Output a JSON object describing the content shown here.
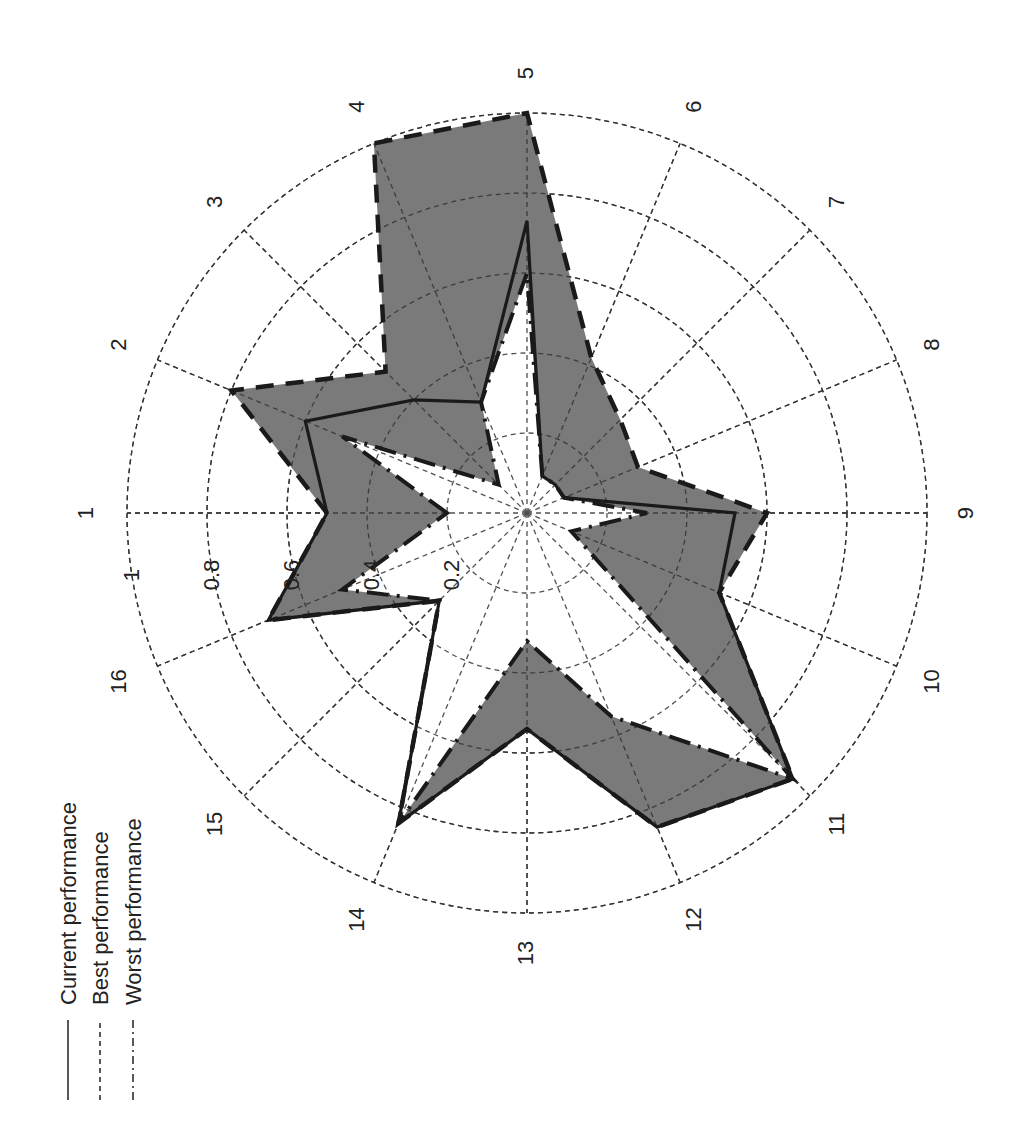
{
  "chart_data": {
    "type": "radar",
    "orientation": "figure rotated 90 degrees counter-clockwise; spoke 1 points left, spoke 5 up, spoke 9 right, spoke 13 down",
    "categories": [
      "1",
      "2",
      "3",
      "4",
      "5",
      "6",
      "7",
      "8",
      "9",
      "10",
      "11",
      "12",
      "13",
      "14",
      "15",
      "16"
    ],
    "series": [
      {
        "name": "Current performance",
        "style": "solid",
        "values": [
          0.5,
          0.6,
          0.4,
          0.3,
          0.73,
          0.1,
          0.1,
          0.1,
          0.52,
          0.52,
          0.94,
          0.85,
          0.54,
          0.84,
          0.31,
          0.7
        ]
      },
      {
        "name": "Best performance",
        "style": "dashed",
        "values": [
          0.5,
          0.8,
          0.5,
          1.0,
          1.0,
          0.42,
          0.33,
          0.3,
          0.6,
          0.52,
          0.94,
          0.85,
          0.54,
          0.84,
          0.31,
          0.7
        ]
      },
      {
        "name": "Worst performance",
        "style": "dash-dot",
        "values": [
          0.2,
          0.5,
          0.1,
          0.3,
          0.6,
          0.1,
          0.1,
          0.1,
          0.3,
          0.12,
          0.94,
          0.55,
          0.32,
          0.84,
          0.31,
          0.5
        ]
      }
    ],
    "radial_ticks": [
      "0.2",
      "0.4",
      "0.6",
      "0.8",
      "1"
    ],
    "rlim": [
      0,
      1
    ],
    "grid": true,
    "fill": "gray band between best and worst performance",
    "legend": {
      "position": "left (rotated)",
      "entries": [
        "Current performance",
        "Best performance",
        "Worst performance"
      ]
    },
    "title": "",
    "xlabel": "",
    "ylabel": ""
  },
  "legend": {
    "current": "Current performance",
    "best": "Best performance",
    "worst": "Worst performance"
  }
}
